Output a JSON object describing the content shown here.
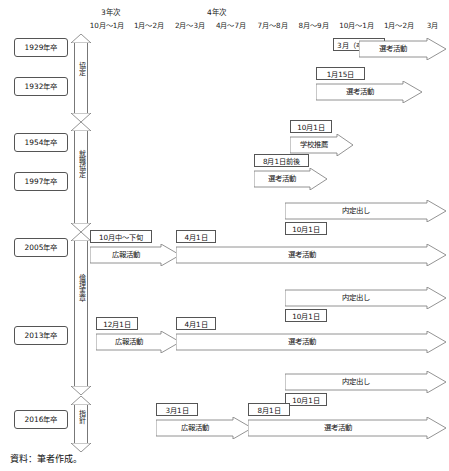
{
  "header": {
    "tier_labels": [
      {
        "text": "3年次"
      },
      {
        "text": "4年次"
      }
    ],
    "months": [
      "10月〜1月",
      "1月〜2月",
      "2月〜3月",
      "4月〜7月",
      "7月〜8月",
      "8月〜9月",
      "10月〜1月",
      "1月〜2月",
      "3月"
    ]
  },
  "years": [
    {
      "label": "1929年卒"
    },
    {
      "label": "1932年卒"
    },
    {
      "label": "1954年卒"
    },
    {
      "label": "1997年卒"
    },
    {
      "label": "2005年卒"
    },
    {
      "label": "2013年卒"
    },
    {
      "label": "2016年卒"
    }
  ],
  "eras": [
    {
      "label": "協定"
    },
    {
      "label": "就職協定"
    },
    {
      "label": "倫理憲章"
    },
    {
      "label": "指針"
    }
  ],
  "rows": [
    {
      "year": "1929年卒",
      "arrows": [
        {
          "label": "選考活動"
        }
      ],
      "dates": [
        {
          "label": "3月（卒業後）"
        }
      ]
    },
    {
      "year": "1932年卒",
      "arrows": [
        {
          "label": "選考活動"
        }
      ],
      "dates": [
        {
          "label": "1月15日"
        }
      ]
    },
    {
      "year": "1954年卒",
      "arrows": [
        {
          "label": "学校推薦"
        }
      ],
      "dates": [
        {
          "label": "10月1日"
        }
      ]
    },
    {
      "year": "1997年卒",
      "arrows": [
        {
          "label": "選考活動"
        }
      ],
      "dates": [
        {
          "label": "8月1日前後"
        }
      ]
    },
    {
      "year": "2005年卒",
      "arrows": [
        {
          "label": "内定出し"
        },
        {
          "label": "広報活動"
        },
        {
          "label": "選考活動"
        }
      ],
      "dates": [
        {
          "label": "10月1日"
        },
        {
          "label": "10月中〜下旬"
        },
        {
          "label": "4月1日"
        }
      ]
    },
    {
      "year": "2013年卒",
      "arrows": [
        {
          "label": "内定出し"
        },
        {
          "label": "広報活動"
        },
        {
          "label": "選考活動"
        }
      ],
      "dates": [
        {
          "label": "10月1日"
        },
        {
          "label": "12月1日"
        },
        {
          "label": "4月1日"
        }
      ]
    },
    {
      "year": "2016年卒",
      "arrows": [
        {
          "label": "内定出し"
        },
        {
          "label": "広報活動"
        },
        {
          "label": "選考活動"
        }
      ],
      "dates": [
        {
          "label": "10月1日"
        },
        {
          "label": "3月1日"
        },
        {
          "label": "8月1日"
        }
      ]
    }
  ],
  "caption": "資料：筆者作成。",
  "colors": {
    "line": "#777777",
    "box_border": "#555555",
    "text": "#111111",
    "background": "#ffffff"
  }
}
